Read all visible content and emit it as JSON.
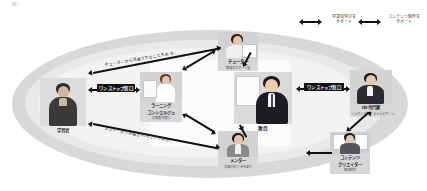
{
  "diagram": {
    "corner_note": "図1",
    "title_hidden": "",
    "center_role": {
      "name": "教員",
      "sub": ""
    },
    "roles": [
      {
        "id": "learner",
        "name": "学習者",
        "sub": ""
      },
      {
        "id": "tutor",
        "name": "チューター",
        "sub": "学習のサポート役"
      },
      {
        "id": "mentor",
        "name": "メンター",
        "sub": "気づきを促す支援者"
      },
      {
        "id": "concierge",
        "name": "ラーニング\nコンシェルジュ",
        "sub": "学習の窓口"
      },
      {
        "id": "id-expert",
        "name": "ID専門家",
        "sub": "インストラクショナルデザイン"
      },
      {
        "id": "creator",
        "name": "コンテンツ\nクリエイター",
        "sub": "教材制作"
      },
      {
        "id": "staff",
        "name": "職員",
        "sub": ""
      }
    ],
    "role_labels": {
      "learner": "学習者",
      "tutor": "チューター",
      "tutor_sub": "教員のサポート役",
      "mentor": "メンター",
      "mentor_sub": "学習の気づきを促す",
      "concierge": "ラーニング\nコンシェルジュ",
      "concierge_line1": "ラーニング",
      "concierge_line2": "コンシェルジュ",
      "concierge_sub": "学習者の窓口",
      "teacher": "教員",
      "id_expert": "ID専門家",
      "id_expert_sub": "インストラクショナルデザイン",
      "creator_line1": "コンテンツ",
      "creator_line2": "クリエイター",
      "creator_sub": "教材制作"
    },
    "bars": [
      {
        "id": "onestop-left",
        "label": "ワンストップ窓口"
      },
      {
        "id": "onestop-right",
        "label": "ワンストップ窓口"
      }
    ],
    "annotations": [
      {
        "id": "tutor-dispatch",
        "text": "チューターから派遣されることもある。"
      },
      {
        "id": "mentor-dispatch",
        "text": "メンターから派遣されることもある。"
      }
    ],
    "top_notes": [
      {
        "id": "learning-support",
        "line1": "学習の学びを",
        "line2": "サポート"
      },
      {
        "id": "content-support",
        "line1": "コンテンツ制作を",
        "line2": "サポート"
      }
    ],
    "colors": {
      "arrow": "#111111",
      "bar_bg": "#141414",
      "bar_text": "#ffffff",
      "ellipse_outer": "#d8d8d8",
      "ellipse_inner": "#e9e9e9",
      "card_bg": "#d7d7d7"
    }
  }
}
